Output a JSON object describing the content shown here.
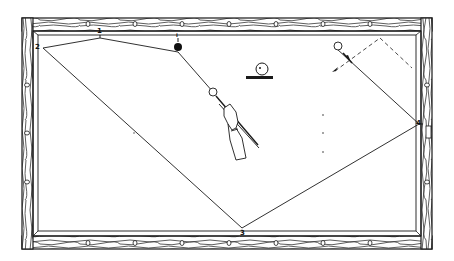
{
  "figure": {
    "colors": {
      "ink": "#1a1a1a",
      "paper": "#ffffff",
      "wood_grain": "#2a2a2a"
    },
    "rail_labels": [
      {
        "id": "1",
        "text": "1"
      },
      {
        "id": "2",
        "text": "2"
      },
      {
        "id": "3",
        "text": "3"
      },
      {
        "id": "4",
        "text": "4"
      }
    ],
    "object_ball_label": "I",
    "balls": [
      {
        "name": "object-ball-black",
        "fill": "#111111"
      },
      {
        "name": "cue-ball",
        "fill": "#ffffff"
      },
      {
        "name": "target-ball-upper-right",
        "fill": "#ffffff"
      }
    ],
    "legend_symbol": "ball-on-cushion-icon",
    "path_points": [
      "cue ball",
      "object ball",
      "1",
      "2",
      "3",
      "4",
      "target ball"
    ]
  }
}
